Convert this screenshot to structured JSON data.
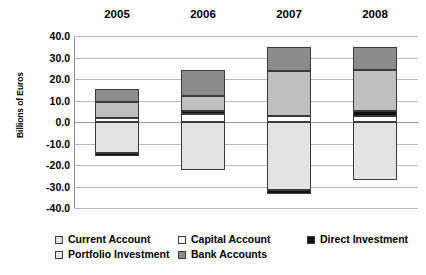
{
  "chart_data": {
    "type": "bar",
    "subtype": "stacked-bar-diverging",
    "title": "",
    "xlabel": "",
    "ylabel": "Billions of Euros",
    "categories": [
      "2005",
      "2006",
      "2007",
      "2008"
    ],
    "ylim": [
      -40.0,
      40.0
    ],
    "ytick_step": 10.0,
    "yticks": [
      "40.0",
      "30.0",
      "20.0",
      "10.0",
      "0.0",
      "-10.0",
      "-20.0",
      "-30.0",
      "-40.0"
    ],
    "ytick_values": [
      40.0,
      30.0,
      20.0,
      10.0,
      0.0,
      -10.0,
      -20.0,
      -30.0,
      -40.0
    ],
    "grid": true,
    "legend_position": "bottom",
    "series": [
      {
        "name": "Current Account",
        "color": "#e3e3e3",
        "values": [
          -14.5,
          -22.5,
          -31.5,
          -27.0
        ]
      },
      {
        "name": "Capital Account",
        "color": "#ffffff",
        "values": [
          2.0,
          3.5,
          3.0,
          3.0
        ]
      },
      {
        "name": "Direct Investment",
        "color": "#111111",
        "values": [
          -1.5,
          1.5,
          -2.0,
          2.0
        ]
      },
      {
        "name": "Portfolio Investment",
        "color": "#bfbfbf",
        "values": [
          7.5,
          7.0,
          20.5,
          19.0
        ]
      },
      {
        "name": "Bank Accounts",
        "color": "#8c8c8c",
        "values": [
          6.0,
          12.0,
          11.5,
          11.0
        ]
      }
    ]
  },
  "axis": {
    "y_title": "Billions of Euros"
  },
  "legend": {
    "row1": [
      {
        "label": "Current Account",
        "color": "#e3e3e3",
        "name": "current-account"
      },
      {
        "label": "Capital Account",
        "color": "#ffffff",
        "name": "capital-account"
      },
      {
        "label": "Direct Investment",
        "color": "#111111",
        "name": "direct-investment"
      }
    ],
    "row2": [
      {
        "label": "Portfolio Investment",
        "color": "#e8e8e8",
        "name": "portfolio-investment"
      },
      {
        "label": "Bank Accounts",
        "color": "#8c8c8c",
        "name": "bank-accounts"
      }
    ]
  }
}
